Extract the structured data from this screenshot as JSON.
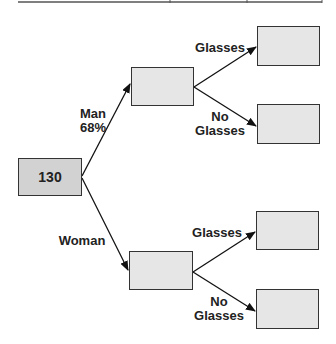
{
  "diagram": {
    "type": "probability-tree",
    "root": {
      "value": "130"
    },
    "branches": [
      {
        "label": "Man",
        "percent": "68%",
        "node_value": "",
        "children": [
          {
            "label": "Glasses",
            "node_value": ""
          },
          {
            "label_line1": "No",
            "label_line2": "Glasses",
            "node_value": ""
          }
        ]
      },
      {
        "label": "Woman",
        "percent": "",
        "node_value": "",
        "children": [
          {
            "label": "Glasses",
            "node_value": ""
          },
          {
            "label_line1": "No",
            "label_line2": "Glasses",
            "node_value": ""
          }
        ]
      }
    ],
    "colors": {
      "root_fill": "#d2d2d2",
      "node_fill": "#e6e6e6",
      "stroke": "#333333"
    }
  }
}
